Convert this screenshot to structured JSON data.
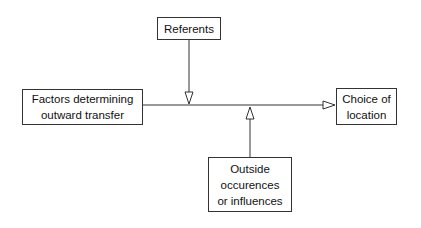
{
  "diagram": {
    "nodes": [
      {
        "id": "referents",
        "lines": [
          "Referents"
        ]
      },
      {
        "id": "factors",
        "lines": [
          "Factors determining",
          "outward transfer"
        ]
      },
      {
        "id": "choice",
        "lines": [
          "Choice of",
          "location"
        ]
      },
      {
        "id": "outside",
        "lines": [
          "Outside",
          "occurences",
          "or influences"
        ]
      }
    ],
    "edges": [
      {
        "from": "factors",
        "to": "choice",
        "label": ""
      },
      {
        "from": "referents",
        "to": "main-flow",
        "label": ""
      },
      {
        "from": "outside",
        "to": "main-flow",
        "label": ""
      }
    ],
    "colors": {
      "stroke": "#333333",
      "background": "#ffffff",
      "text": "#111111"
    }
  }
}
